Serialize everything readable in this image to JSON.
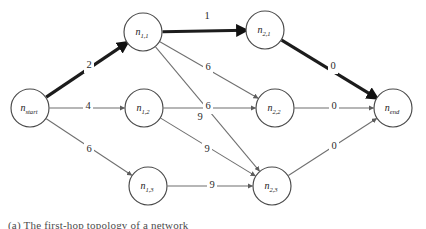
{
  "figure": {
    "type": "directed-weighted-graph",
    "caption": "(a) The first-hop topology of a network",
    "background_color": "#ffffff",
    "thin_edge_color": "#6f6f6f",
    "thick_edge_color": "#1c1c1c",
    "node_stroke_color": "#4a4a4a",
    "node_fill_color": "#ffffff"
  },
  "nodes": [
    {
      "id": "n_start",
      "base": "n",
      "sub": "start",
      "cx": 30,
      "cy": 108,
      "r": 19
    },
    {
      "id": "n_1_1",
      "base": "n",
      "sub": "1,1",
      "cx": 143,
      "cy": 32,
      "r": 19
    },
    {
      "id": "n_1_2",
      "base": "n",
      "sub": "1,2",
      "cx": 144,
      "cy": 108,
      "r": 19
    },
    {
      "id": "n_1_3",
      "base": "n",
      "sub": "1,3",
      "cx": 148,
      "cy": 186,
      "r": 19
    },
    {
      "id": "n_2_1",
      "base": "n",
      "sub": "2,1",
      "cx": 265,
      "cy": 30,
      "r": 19
    },
    {
      "id": "n_2_2",
      "base": "n",
      "sub": "2,2",
      "cx": 275,
      "cy": 108,
      "r": 19
    },
    {
      "id": "n_2_3",
      "base": "n",
      "sub": "2,3",
      "cx": 272,
      "cy": 186,
      "r": 19
    },
    {
      "id": "n_end",
      "base": "n",
      "sub": "end",
      "cx": 393,
      "cy": 108,
      "r": 19
    }
  ],
  "edges": [
    {
      "id": "e-start-11",
      "from": "n_start",
      "to": "n_1_1",
      "weight": "2",
      "highlighted": true,
      "label_x": 89,
      "label_y": 66
    },
    {
      "id": "e-start-12",
      "from": "n_start",
      "to": "n_1_2",
      "weight": "4",
      "highlighted": false,
      "label_x": 88,
      "label_y": 107
    },
    {
      "id": "e-start-13",
      "from": "n_start",
      "to": "n_1_3",
      "weight": "6",
      "highlighted": false,
      "label_x": 89,
      "label_y": 150
    },
    {
      "id": "e-11-21",
      "from": "n_1_1",
      "to": "n_2_1",
      "weight": "1",
      "highlighted": true,
      "label_x": 207,
      "label_y": 17
    },
    {
      "id": "e-11-22",
      "from": "n_1_1",
      "to": "n_2_2",
      "weight": "6",
      "highlighted": false,
      "label_x": 208,
      "label_y": 68
    },
    {
      "id": "e-11-23",
      "from": "n_1_1",
      "to": "n_2_3",
      "weight": "9",
      "highlighted": false,
      "label_x": 200,
      "label_y": 118
    },
    {
      "id": "e-12-22",
      "from": "n_1_2",
      "to": "n_2_2",
      "weight": "6",
      "highlighted": false,
      "label_x": 208,
      "label_y": 107
    },
    {
      "id": "e-12-23",
      "from": "n_1_2",
      "to": "n_2_3",
      "weight": "9",
      "highlighted": false,
      "label_x": 207,
      "label_y": 150
    },
    {
      "id": "e-13-23",
      "from": "n_1_3",
      "to": "n_2_3",
      "weight": "9",
      "highlighted": false,
      "label_x": 212,
      "label_y": 186
    },
    {
      "id": "e-21-end",
      "from": "n_2_1",
      "to": "n_end",
      "weight": "0",
      "highlighted": true,
      "label_x": 333,
      "label_y": 67
    },
    {
      "id": "e-22-end",
      "from": "n_2_2",
      "to": "n_end",
      "weight": "0",
      "highlighted": false,
      "label_x": 334,
      "label_y": 107
    },
    {
      "id": "e-23-end",
      "from": "n_2_3",
      "to": "n_end",
      "weight": "0",
      "highlighted": false,
      "label_x": 334,
      "label_y": 147
    }
  ],
  "chart_data": {
    "type": "diagram",
    "node_ids": [
      "n_start",
      "n_1,1",
      "n_1,2",
      "n_1,3",
      "n_2,1",
      "n_2,2",
      "n_2,3",
      "n_end"
    ],
    "edge_list": [
      [
        "n_start",
        "n_1,1",
        2
      ],
      [
        "n_start",
        "n_1,2",
        4
      ],
      [
        "n_start",
        "n_1,3",
        6
      ],
      [
        "n_1,1",
        "n_2,1",
        1
      ],
      [
        "n_1,1",
        "n_2,2",
        6
      ],
      [
        "n_1,1",
        "n_2,3",
        9
      ],
      [
        "n_1,2",
        "n_2,2",
        6
      ],
      [
        "n_1,2",
        "n_2,3",
        9
      ],
      [
        "n_1,3",
        "n_2,3",
        9
      ],
      [
        "n_2,1",
        "n_end",
        0
      ],
      [
        "n_2,2",
        "n_end",
        0
      ],
      [
        "n_2,3",
        "n_end",
        0
      ]
    ],
    "highlighted_path": [
      "n_start",
      "n_1,1",
      "n_2,1",
      "n_end"
    ],
    "highlighted_path_cost": 3
  }
}
